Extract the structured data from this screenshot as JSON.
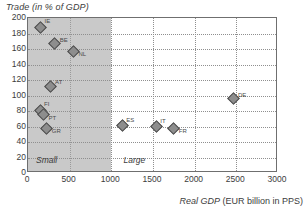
{
  "chart_data": {
    "type": "scatter",
    "title": "",
    "ylabel": "Trade (in % of GDP)",
    "xlabel_italic": "Real GDP",
    "xlabel_rest": " (EUR billion in PPS)",
    "xlabel": "Real GDP (EUR billion in PPS)",
    "xlim": [
      0,
      3000
    ],
    "ylim": [
      0,
      200
    ],
    "xticks": [
      0,
      500,
      1000,
      1500,
      2000,
      2500,
      3000
    ],
    "yticks": [
      0,
      20,
      40,
      60,
      80,
      100,
      120,
      140,
      160,
      180,
      200
    ],
    "grid": true,
    "legend": "none",
    "regions": [
      {
        "label": "Small",
        "x_start": 0,
        "x_end": 1000,
        "shaded": true
      },
      {
        "label": "Large",
        "x_start": 1000,
        "x_end": 3000,
        "shaded": false
      }
    ],
    "points": [
      {
        "label": "IE",
        "x": 150,
        "y": 188,
        "label_pos": "upper-right"
      },
      {
        "label": "BE",
        "x": 320,
        "y": 167,
        "label_pos": "right"
      },
      {
        "label": "NL",
        "x": 545,
        "y": 157,
        "label_pos": "below-right"
      },
      {
        "label": "AT",
        "x": 265,
        "y": 112,
        "label_pos": "right"
      },
      {
        "label": "FI",
        "x": 145,
        "y": 81,
        "label_pos": "upper-right"
      },
      {
        "label": "PT",
        "x": 185,
        "y": 75,
        "label_pos": "below-right"
      },
      {
        "label": "GR",
        "x": 225,
        "y": 58,
        "label_pos": "below-right"
      },
      {
        "label": "ES",
        "x": 1130,
        "y": 61,
        "label_pos": "upper-right"
      },
      {
        "label": "IT",
        "x": 1540,
        "y": 60,
        "label_pos": "upper-right"
      },
      {
        "label": "FR",
        "x": 1750,
        "y": 58,
        "label_pos": "below-right"
      },
      {
        "label": "DE",
        "x": 2460,
        "y": 96,
        "label_pos": "right"
      }
    ],
    "colors": {
      "marker_fill": "#8d8d8d",
      "marker_edge": "#4a4a4a",
      "shaded_region": "#c9c9c9",
      "gridline": "#8f8f8f",
      "frame": "#6f6f6f",
      "text": "#3c3c3c",
      "background": "#ffffff"
    }
  }
}
